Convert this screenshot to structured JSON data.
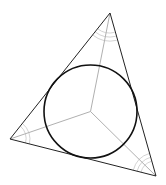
{
  "diagram": {
    "type": "triangle-incircle",
    "canvas": {
      "width": 166,
      "height": 185,
      "background": "#ffffff"
    },
    "triangle": {
      "vertices": [
        {
          "name": "A",
          "x": 110,
          "y": 13
        },
        {
          "name": "B",
          "x": 10,
          "y": 139
        },
        {
          "name": "C",
          "x": 156,
          "y": 176
        }
      ],
      "stroke": "#222222",
      "stroke_width": 1
    },
    "incenter": {
      "x": 90.5,
      "y": 111.5
    },
    "incircle": {
      "cx": 90.5,
      "cy": 111.5,
      "r": 46.5,
      "stroke": "#111111",
      "stroke_width": 1.6
    },
    "bisectors": {
      "stroke": "#b0b0b0",
      "stroke_width": 1
    },
    "angle_arcs": {
      "stroke": "#c8c8c8",
      "stroke_width": 0.8
    }
  }
}
